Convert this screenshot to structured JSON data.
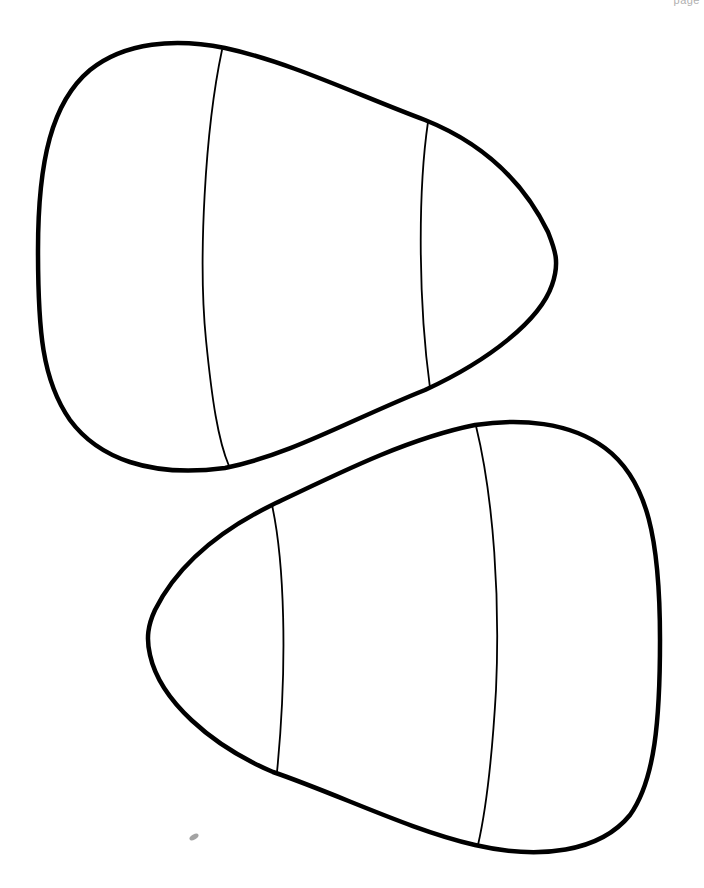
{
  "page": {
    "label": "page",
    "background": "#ffffff",
    "line_color": "#000000"
  },
  "shapes": [
    {
      "name": "candy-corn-top",
      "orientation": "tip-right",
      "bands": 3
    },
    {
      "name": "candy-corn-bottom",
      "orientation": "tip-left",
      "bands": 3
    }
  ]
}
